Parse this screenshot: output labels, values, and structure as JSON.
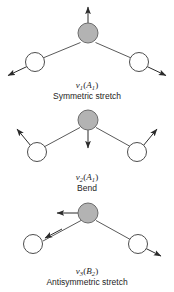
{
  "figure": {
    "background_color": "#ffffff",
    "central_atom_fill": "#b3b3b3",
    "central_atom_stroke": "#6b6b6b",
    "outer_atom_fill": "#ffffff",
    "outer_atom_stroke": "#4d4d4d",
    "bond_color": "#5a5a5a",
    "arrow_color": "#2b2b2b"
  },
  "modes": [
    {
      "id": "mode-1",
      "symbol_nu": "ν",
      "symbol_index": "1",
      "symmetry_open": "(",
      "symmetry_letter": "A",
      "symmetry_sub": "1",
      "symmetry_close": ")",
      "symbol_full": "ν₁(A₁)",
      "name": "Symmetric stretch",
      "central_atom": {
        "label": "central-atom",
        "type": "filled",
        "arrow_direction": "up"
      },
      "left_atom": {
        "label": "left-atom",
        "type": "open",
        "arrow_direction": "down-left"
      },
      "right_atom": {
        "label": "right-atom",
        "type": "open",
        "arrow_direction": "down-right"
      }
    },
    {
      "id": "mode-2",
      "symbol_nu": "ν",
      "symbol_index": "2",
      "symmetry_open": "(",
      "symmetry_letter": "A",
      "symmetry_sub": "1",
      "symmetry_close": ")",
      "symbol_full": "ν₂(A₁)",
      "name": "Bend",
      "central_atom": {
        "label": "central-atom",
        "type": "filled",
        "arrow_direction": "down"
      },
      "left_atom": {
        "label": "left-atom",
        "type": "open",
        "arrow_direction": "up-left"
      },
      "right_atom": {
        "label": "right-atom",
        "type": "open",
        "arrow_direction": "up-right"
      }
    },
    {
      "id": "mode-3",
      "symbol_nu": "ν",
      "symbol_index": "3",
      "symmetry_open": "(",
      "symmetry_letter": "B",
      "symmetry_sub": "2",
      "symmetry_close": ")",
      "symbol_full": "ν₃(B₂)",
      "name": "Antisymmetric stretch",
      "central_atom": {
        "label": "central-atom",
        "type": "filled",
        "arrow_direction": "left"
      },
      "left_atom": {
        "label": "left-atom",
        "type": "open",
        "arrow_direction": "up-right"
      },
      "right_atom": {
        "label": "right-atom",
        "type": "open",
        "arrow_direction": "down-right"
      }
    }
  ]
}
